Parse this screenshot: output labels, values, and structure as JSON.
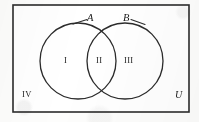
{
  "figure": {
    "type": "venn-diagram",
    "stroke_color": "#2b2b2b",
    "fill_color": "#ffffff",
    "background_color": "#fdfdfc"
  },
  "universe": {
    "label": "U",
    "border": {
      "x": 13,
      "y": 5,
      "width": 176,
      "height": 107
    }
  },
  "sets": [
    {
      "label": "A",
      "cx": 78,
      "cy": 61,
      "r": 38,
      "leader_from_x": 88,
      "leader_from_y": 19,
      "leader_to_x": 73,
      "leader_to_y": 24
    },
    {
      "label": "B",
      "cx": 125,
      "cy": 61,
      "r": 38,
      "leader_from_x": 130,
      "leader_from_y": 19,
      "leader_to_x": 145,
      "leader_to_y": 25
    }
  ],
  "regions": [
    {
      "label": "I",
      "meaning": "A only",
      "x": 64,
      "y": 56
    },
    {
      "label": "II",
      "meaning": "A intersect B",
      "x": 97,
      "y": 56
    },
    {
      "label": "III",
      "meaning": "B only",
      "x": 127,
      "y": 56
    },
    {
      "label": "IV",
      "meaning": "outside A and B",
      "x": 22,
      "y": 90
    }
  ]
}
